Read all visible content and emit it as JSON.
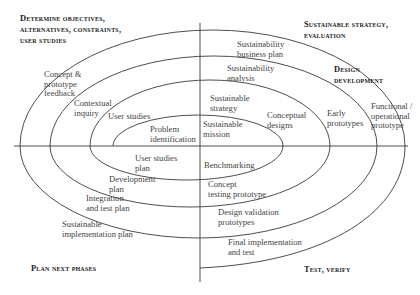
{
  "quadrants": {
    "top_left": {
      "lines": [
        "Determine objectives,",
        "alternatives, constraints,",
        "user studies"
      ]
    },
    "top_right": {
      "lines": [
        "Sustainable strategy,",
        "evaluation"
      ]
    },
    "right": {
      "lines": [
        "Design",
        "development"
      ]
    },
    "bottom_left": {
      "lines": [
        "Plan next phases"
      ]
    },
    "bottom_right": {
      "lines": [
        "Test, verify"
      ]
    }
  },
  "labels": {
    "concept_feedback": [
      "Concept &",
      "prototype",
      "feedback"
    ],
    "contextual_inquiry": [
      "Contextual",
      "inquiry"
    ],
    "user_studies": [
      "User studies"
    ],
    "problem_identification": [
      "Problem",
      "identification"
    ],
    "sustainable_mission": [
      "Sustainable",
      "mission"
    ],
    "sustainable_strategy": [
      "Sustainable",
      "strategy"
    ],
    "sustainability_analysis": [
      "Sustainability",
      "analysis"
    ],
    "sustainability_business_plan": [
      "Sustainability",
      "business plan"
    ],
    "conceptual_designs": [
      "Conceptual",
      "designs"
    ],
    "early_prototypes": [
      "Early",
      "prototypes"
    ],
    "functional_prototype": [
      "Functional /",
      "operational",
      "prototype"
    ],
    "benchmarking": [
      "Benchmarking"
    ],
    "concept_testing": [
      "Concept",
      "testing prototype"
    ],
    "design_validation": [
      "Design validation",
      "prototypes"
    ],
    "final_implementation": [
      "Final implementation",
      "and test"
    ],
    "user_studies_plan": [
      "User studies",
      "plan"
    ],
    "development_plan": [
      "Development",
      "plan"
    ],
    "integration_plan": [
      "Integration",
      "and test plan"
    ],
    "sustainable_implementation_plan": [
      "Sustainable",
      "implementation plan"
    ]
  },
  "colors": {
    "line": "#3a3a3a",
    "text": "#444444",
    "heading": "#222222"
  }
}
